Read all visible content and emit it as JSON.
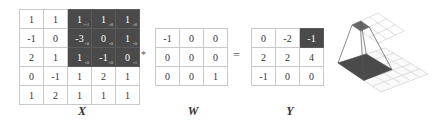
{
  "diagram": {
    "operators": {
      "convolve": "*",
      "equals": "="
    },
    "colors": {
      "highlight_cell": "#4a4a4a",
      "grid_line": "#c9c9c9",
      "text": "#333333",
      "highlight_text": "#ffffff"
    },
    "input": {
      "label": "X",
      "rows": [
        [
          {
            "v": "1"
          },
          {
            "v": "1"
          },
          {
            "v": "1",
            "sub": "×-1",
            "hl": true
          },
          {
            "v": "1",
            "sub": "×0",
            "hl": true
          },
          {
            "v": "1",
            "sub": "×0",
            "hl": true
          }
        ],
        [
          {
            "v": "-1"
          },
          {
            "v": "0"
          },
          {
            "v": "-3",
            "sub": "×0",
            "hl": true
          },
          {
            "v": "0",
            "sub": "×0",
            "hl": true
          },
          {
            "v": "1",
            "sub": "×0",
            "hl": true
          }
        ],
        [
          {
            "v": "2"
          },
          {
            "v": "1"
          },
          {
            "v": "1",
            "sub": "×0",
            "hl": true
          },
          {
            "v": "-1",
            "sub": "×0",
            "hl": true
          },
          {
            "v": "0",
            "sub": "×1",
            "hl": true
          }
        ],
        [
          {
            "v": "0"
          },
          {
            "v": "-1"
          },
          {
            "v": "1"
          },
          {
            "v": "2"
          },
          {
            "v": "1"
          }
        ],
        [
          {
            "v": "1"
          },
          {
            "v": "2"
          },
          {
            "v": "1"
          },
          {
            "v": "1"
          },
          {
            "v": "1"
          }
        ]
      ]
    },
    "kernel": {
      "label": "W",
      "rows": [
        [
          {
            "v": "-1"
          },
          {
            "v": "0"
          },
          {
            "v": "0"
          }
        ],
        [
          {
            "v": "0"
          },
          {
            "v": "0"
          },
          {
            "v": "0"
          }
        ],
        [
          {
            "v": "0"
          },
          {
            "v": "0"
          },
          {
            "v": "1"
          }
        ]
      ]
    },
    "output": {
      "label": "Y",
      "rows": [
        [
          {
            "v": "0"
          },
          {
            "v": "-2"
          },
          {
            "v": "-1",
            "hl": true
          }
        ],
        [
          {
            "v": "2"
          },
          {
            "v": "2"
          },
          {
            "v": "4"
          }
        ],
        [
          {
            "v": "-1"
          },
          {
            "v": "0"
          },
          {
            "v": "0"
          }
        ]
      ]
    },
    "illustration": {
      "description": "3D view: 3x3 receptive field on 5x5 input mapped to one output cell on 3x3 output"
    }
  }
}
